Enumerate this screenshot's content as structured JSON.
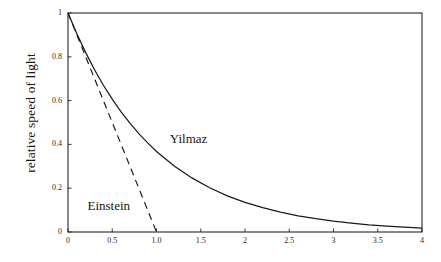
{
  "chart_data": {
    "type": "line",
    "title": "",
    "xlabel": "",
    "ylabel": "relative speed of light",
    "xlim": [
      0,
      4
    ],
    "ylim": [
      0,
      1
    ],
    "grid": false,
    "legend_position": "inline-annotation",
    "xticks": [
      "0",
      "0.5",
      "1.0",
      "1.5",
      "2",
      "2.5",
      "3",
      "3.5",
      "4"
    ],
    "xtick_values": [
      0,
      0.5,
      1.0,
      1.5,
      2,
      2.5,
      3,
      3.5,
      4
    ],
    "yticks": [
      "0",
      "0.2",
      "0.4",
      "0.6",
      "0.8",
      "1"
    ],
    "ytick_values": [
      0,
      0.2,
      0.4,
      0.6,
      0.8,
      1
    ],
    "series": [
      {
        "name": "Yilmaz",
        "style": "solid",
        "color": "#1a1a1a",
        "annotation": "Yilmaz",
        "x": [
          0,
          0.1,
          0.2,
          0.3,
          0.4,
          0.5,
          0.6,
          0.7,
          0.8,
          0.9,
          1.0,
          1.2,
          1.4,
          1.6,
          1.8,
          2.0,
          2.2,
          2.4,
          2.6,
          2.8,
          3.0,
          3.2,
          3.4,
          3.6,
          3.8,
          4.0
        ],
        "values": [
          1.0,
          0.905,
          0.819,
          0.741,
          0.67,
          0.607,
          0.549,
          0.497,
          0.449,
          0.407,
          0.368,
          0.301,
          0.247,
          0.202,
          0.165,
          0.135,
          0.111,
          0.091,
          0.074,
          0.061,
          0.05,
          0.041,
          0.033,
          0.027,
          0.022,
          0.018
        ]
      },
      {
        "name": "Einstein",
        "style": "dashed",
        "color": "#1a1a1a",
        "annotation": "Einstein",
        "x": [
          0,
          0.25,
          0.5,
          0.75,
          1.0
        ],
        "values": [
          1.0,
          0.75,
          0.5,
          0.25,
          0.0
        ]
      }
    ],
    "annotations": [
      {
        "text": "Yilmaz",
        "x": 1.15,
        "y": 0.42
      },
      {
        "text": "Einstein",
        "x": 0.22,
        "y": 0.115
      }
    ]
  }
}
